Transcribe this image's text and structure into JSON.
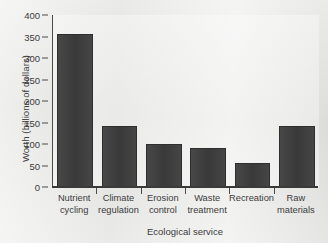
{
  "chart_data": {
    "type": "bar",
    "title": "",
    "xlabel": "Ecological service",
    "ylabel": "Worth (billions of dollars)",
    "categories": [
      "Nutrient cycling",
      "Climate regulation",
      "Erosion control",
      "Waste treatment",
      "Recreation",
      "Raw materials"
    ],
    "category_lines": [
      [
        "Nutrient",
        "cycling"
      ],
      [
        "Climate",
        "regulation"
      ],
      [
        "Erosion",
        "control"
      ],
      [
        "Waste",
        "treatment"
      ],
      [
        "Recreation",
        ""
      ],
      [
        "Raw",
        "materials"
      ]
    ],
    "values": [
      357,
      143,
      100,
      90,
      55,
      143
    ],
    "ylim": [
      0,
      400
    ],
    "yticks": [
      0,
      50,
      100,
      150,
      200,
      250,
      300,
      350,
      400
    ],
    "ytick_labels": [
      "0",
      "50",
      "100",
      "150",
      "200",
      "250",
      "300",
      "350",
      "400"
    ],
    "grid": false,
    "legend": false,
    "bar_color": "#3e3e3e",
    "axis_color": "#4a4a4a",
    "text_color": "#3b3b3b",
    "background_color": "#e8e8e6"
  }
}
